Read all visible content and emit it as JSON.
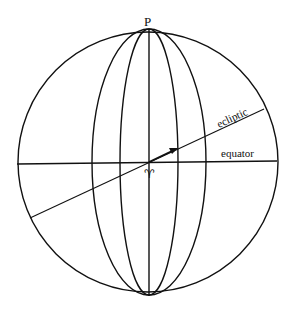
{
  "diagram": {
    "labels": {
      "pole": "P",
      "ecliptic": "ecliptic",
      "equator": "equator",
      "vernal_equinox": "♈︎"
    },
    "colors": {
      "stroke": "#111111",
      "background": "#ffffff"
    }
  }
}
